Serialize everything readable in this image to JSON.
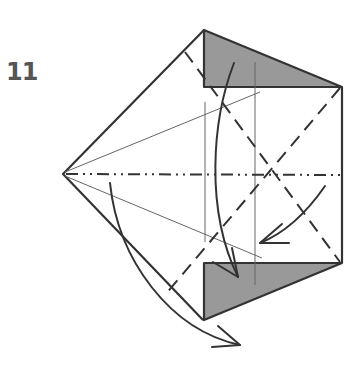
{
  "diagram": {
    "type": "origami-folding-step",
    "step_number": "11",
    "colors": {
      "line": "#333333",
      "thin_line": "#666666",
      "shaded_flap": "#999999",
      "background": "#ffffff"
    },
    "elements": [
      {
        "kind": "outline",
        "description": "pentagon-shaped folded paper outline"
      },
      {
        "kind": "shaded-flap",
        "position": "top",
        "description": "grey triangular flap (back side of paper)"
      },
      {
        "kind": "shaded-flap",
        "position": "bottom",
        "description": "grey triangular flap (back side of paper)"
      },
      {
        "kind": "valley-fold",
        "style": "dashed",
        "description": "diagonal X valley folds"
      },
      {
        "kind": "mountain-fold",
        "style": "dash-dot",
        "description": "horizontal center mountain fold"
      },
      {
        "kind": "reference-crease",
        "style": "thin",
        "description": "thin existing creases"
      },
      {
        "kind": "arrow",
        "description": "curved fold arrows indicating folding motion"
      }
    ]
  }
}
